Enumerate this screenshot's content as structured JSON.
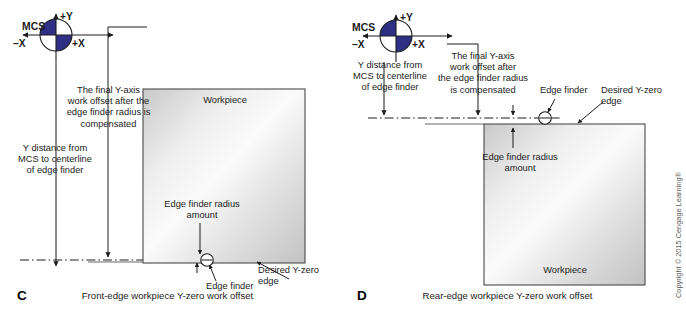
{
  "figure": {
    "copyright": "Copyright © 2015 Cengage Learning®",
    "colors": {
      "mcs_navy": "#2f2f86",
      "line": "#1c1c1c",
      "workpiece_edge": "#4a4a4a",
      "workpiece_light": "#f6f6f6",
      "workpiece_dark": "#bdbdbd"
    }
  },
  "panel_c": {
    "letter": "C",
    "caption": "Front-edge workpiece Y-zero work offset",
    "mcs_label": "MCS",
    "axis_plus_y": "+Y",
    "axis_plus_x": "+X",
    "axis_minus_x": "–X",
    "workpiece_label": "Workpiece",
    "note_final_offset": "The final Y-axis\nwork offset after the\nedge finder radius is\ncompensated",
    "note_y_distance": "Y distance from\nMCS to centerline\nof edge finder",
    "note_radius_amount": "Edge finder radius\namount",
    "label_edge_finder": "Edge finder",
    "label_desired_zero": "Desired Y-zero\nedge"
  },
  "panel_d": {
    "letter": "D",
    "caption": "Rear-edge workpiece Y-zero work offset",
    "mcs_label": "MCS",
    "axis_plus_y": "+Y",
    "axis_plus_x": "+X",
    "axis_minus_x": "–X",
    "workpiece_label": "Workpiece",
    "note_final_offset": "The final Y-axis\nwork offset after\nthe edge finder radius\nis compensated",
    "note_y_distance": "Y distance from\nMCS to centerline\nof edge finder",
    "note_radius_amount": "Edge finder radius\namount",
    "label_edge_finder": "Edge finder",
    "label_desired_zero": "Desired Y-zero\nedge"
  }
}
